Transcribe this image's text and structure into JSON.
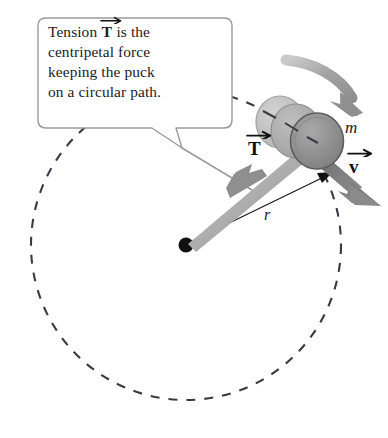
{
  "figure": {
    "background_color": "#ffffff",
    "width": 388,
    "height": 438
  },
  "callout": {
    "lines": [
      {
        "pre": "Tension ",
        "vector": "T",
        "post": " is the"
      },
      {
        "pre": "centripetal force",
        "vector": "",
        "post": ""
      },
      {
        "pre": "keeping the puck",
        "vector": "",
        "post": ""
      },
      {
        "pre": "on a circular path.",
        "vector": "",
        "post": ""
      }
    ],
    "full_text": "Tension T is the centripetal force keeping the puck on a circular path.",
    "border_color": "#9a9a9a",
    "fill_color": "#ffffff"
  },
  "labels": {
    "tension_vector": "T",
    "velocity_vector": "v",
    "mass": "m",
    "radius": "r"
  },
  "colors": {
    "dashed_path": "#3a3a46",
    "center_dot": "#111111",
    "tension_arrow": "#8e8e8e",
    "tension_arrow_dark": "#6e6e6e",
    "velocity_arrow": "#777777",
    "motion_arrow": "#9b9b9b",
    "puck_front": "#8e8e8e",
    "puck_ghost_mid": "#a8a8a8",
    "puck_ghost_back": "#bdbdbd",
    "puck_outline": "#5a5a5a",
    "radius_line": "#1a1a1a",
    "leader_line": "#9a9a9a"
  },
  "geometry": {
    "circle_center_x": 186,
    "circle_center_y": 245,
    "circle_radius": 155,
    "center_dot_radius": 7,
    "puck_front_center_x": 317,
    "puck_front_center_y": 140,
    "puck_radius": 27
  },
  "elements": {
    "dashed_circle_name": "circular-path",
    "center_dot_name": "circle-center-dot",
    "radius_arrow_name": "radius-arrow",
    "tension_arrow_name": "tension-force-arrow",
    "velocity_arrow_name": "velocity-arrow",
    "motion_arrow_name": "rotation-direction-arrow",
    "puck_name": "hockey-puck"
  }
}
